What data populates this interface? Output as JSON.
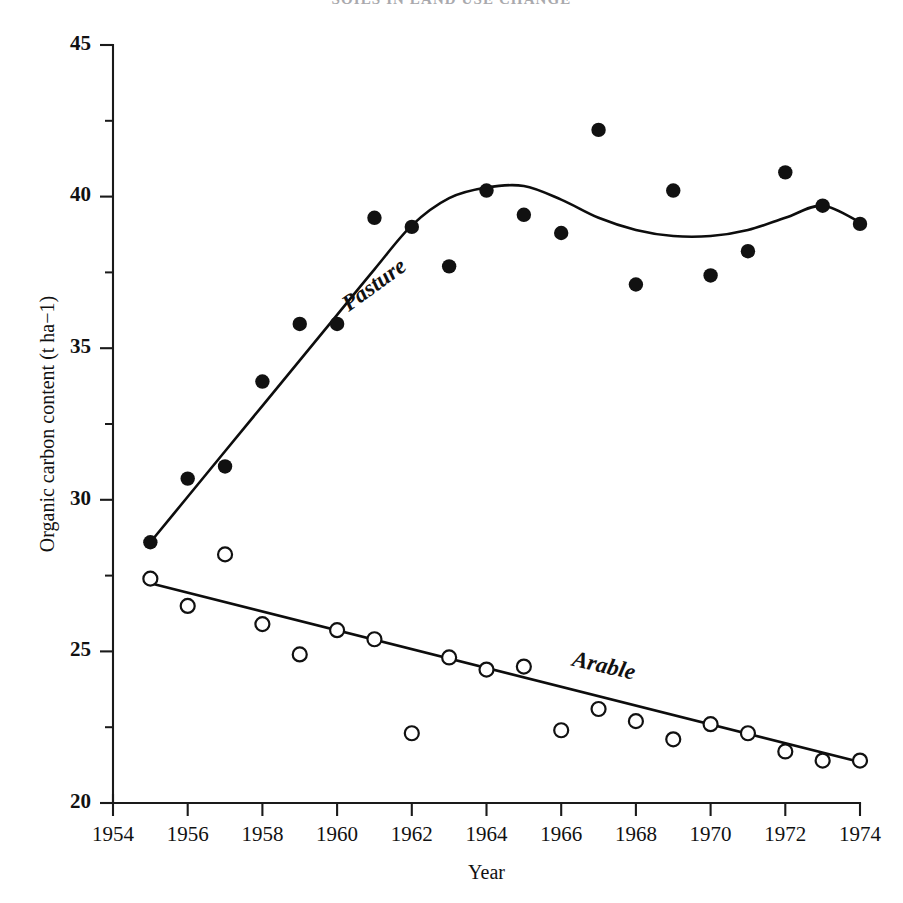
{
  "title": "SOILS IN LAND USE CHANGE",
  "chart_data": {
    "type": "scatter",
    "title": "SOILS IN LAND USE CHANGE",
    "xlabel": "Year",
    "ylabel": "Organic carbon content (t ha−1)",
    "xlim": [
      1954,
      1974
    ],
    "ylim": [
      20,
      45
    ],
    "grid": false,
    "legend_position": "inline-curve-labels",
    "x_ticks": [
      1954,
      1956,
      1958,
      1960,
      1962,
      1964,
      1966,
      1968,
      1970,
      1972,
      1974
    ],
    "x_tick_labels": [
      "1954",
      "1956",
      "1958",
      "1960",
      "1962",
      "1964",
      "1966",
      "1968",
      "1970",
      "1972",
      "1974"
    ],
    "y_ticks": [
      20,
      25,
      30,
      35,
      40,
      45
    ],
    "y_tick_labels": [
      "20",
      "25",
      "30",
      "35",
      "40",
      "45"
    ],
    "y_minor_ticks": [
      22.5,
      27.5,
      32.5,
      37.5,
      42.5
    ],
    "x": [
      1955,
      1956,
      1957,
      1958,
      1959,
      1960,
      1961,
      1962,
      1963,
      1964,
      1965,
      1966,
      1967,
      1968,
      1969,
      1970,
      1971,
      1972,
      1973,
      1974
    ],
    "series": [
      {
        "name": "Pasture",
        "marker": "filled-circle",
        "marker_color": "#111111",
        "label_text": "Pasture",
        "label_x": 1961.1,
        "label_y": 36.9,
        "label_rotation": -36,
        "values": [
          28.6,
          30.7,
          31.1,
          33.9,
          35.8,
          35.8,
          39.3,
          39.0,
          37.7,
          40.2,
          39.4,
          38.8,
          42.2,
          37.1,
          40.2,
          37.4,
          38.2,
          40.8,
          39.7,
          39.1
        ],
        "fit_curve": {
          "description": "rising straight segment 1955-1962 then smooth sigmoid plateau with dip 1962-1974",
          "points": [
            [
              1955,
              28.6
            ],
            [
              1956,
              30.1
            ],
            [
              1957,
              31.6
            ],
            [
              1958,
              33.1
            ],
            [
              1959,
              34.6
            ],
            [
              1960,
              36.1
            ],
            [
              1961,
              37.6
            ],
            [
              1962,
              39.05
            ],
            [
              1963,
              39.95
            ],
            [
              1964,
              40.3
            ],
            [
              1965,
              40.35
            ],
            [
              1966,
              39.9
            ],
            [
              1967,
              39.3
            ],
            [
              1968,
              38.9
            ],
            [
              1969,
              38.7
            ],
            [
              1970,
              38.7
            ],
            [
              1971,
              38.9
            ],
            [
              1972,
              39.3
            ],
            [
              1973,
              39.7
            ],
            [
              1974,
              39.15
            ]
          ]
        }
      },
      {
        "name": "Arable",
        "marker": "open-circle",
        "marker_color": "#111111",
        "label_text": "Arable",
        "label_x": 1967.1,
        "label_y": 24.3,
        "label_rotation": 13,
        "values": [
          27.4,
          26.5,
          28.2,
          25.9,
          24.9,
          25.7,
          25.4,
          22.3,
          24.8,
          24.4,
          24.5,
          22.4,
          23.1,
          22.7,
          22.1,
          22.6,
          22.3,
          21.7,
          21.4,
          21.4
        ],
        "fit_curve": {
          "description": "descending straight regression line 1955 to 1974",
          "points": [
            [
              1955,
              27.25
            ],
            [
              1974,
              21.35
            ]
          ]
        }
      }
    ]
  }
}
